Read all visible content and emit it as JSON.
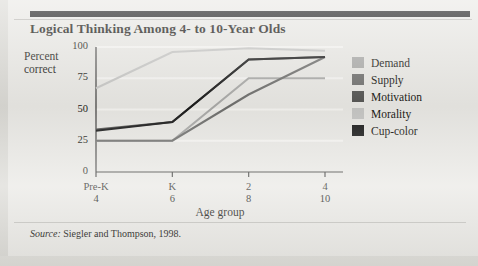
{
  "figure": {
    "title": "Logical Thinking Among 4- to 10-Year Olds",
    "source_prefix": "Source:",
    "source_text": "Siegler and Thompson, 1998."
  },
  "axes": {
    "y_title_line1": "Percent",
    "y_title_line2": "correct",
    "x_title": "Age group",
    "grade_row_label": "Grade:",
    "age_row_label": "Approx. Age:"
  },
  "legend": {
    "position": "right",
    "items": [
      {
        "label": "Demand",
        "color": "#a9a9a7"
      },
      {
        "label": "Supply",
        "color": "#6f6f6d"
      },
      {
        "label": "Motivation",
        "color": "#555553"
      },
      {
        "label": "Morality",
        "color": "#c5c5c3"
      },
      {
        "label": "Cup-color",
        "color": "#1b1b1b"
      }
    ]
  },
  "chart_data": {
    "type": "line",
    "title": "Logical Thinking Among 4- to 10-Year Olds",
    "xlabel": "Age group",
    "ylabel": "Percent correct",
    "ylim": [
      0,
      100
    ],
    "yticks": [
      0,
      25,
      50,
      75,
      100
    ],
    "grid": false,
    "categories": [
      "Pre-K",
      "K",
      "2",
      "4"
    ],
    "x_secondary_label": "Approx. Age:",
    "x_secondary": [
      "4",
      "6",
      "8",
      "10"
    ],
    "x_primary_label": "Grade:",
    "series": [
      {
        "name": "Demand",
        "color": "#a9a9a7",
        "values": [
          25,
          25,
          75,
          75
        ]
      },
      {
        "name": "Supply",
        "color": "#6f6f6d",
        "values": [
          25,
          25,
          62,
          92
        ]
      },
      {
        "name": "Motivation",
        "color": "#555553",
        "values": [
          34,
          40,
          90,
          92
        ]
      },
      {
        "name": "Morality",
        "color": "#c5c5c3",
        "values": [
          67,
          96,
          99,
          97
        ]
      },
      {
        "name": "Cup-color",
        "color": "#1b1b1b",
        "values": [
          33,
          40,
          90,
          92
        ]
      }
    ]
  }
}
